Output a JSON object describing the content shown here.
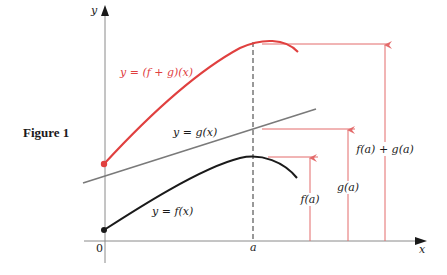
{
  "figure": {
    "title": "Figure 1",
    "axes": {
      "x_label": "x",
      "y_label": "y",
      "origin_label": "0",
      "a_label": "a"
    },
    "curves": {
      "sum": {
        "label": "y = (f + g)(x)",
        "color": "#e0403f"
      },
      "g": {
        "label": "y = g(x)",
        "color": "#7a7a7a"
      },
      "f": {
        "label": "y = f(x)",
        "color": "#1a1a1a"
      }
    },
    "measures": {
      "f_a": "f(a)",
      "g_a": "g(a)",
      "sum_a": "f(a) + g(a)",
      "color": "#e36a6a"
    }
  }
}
